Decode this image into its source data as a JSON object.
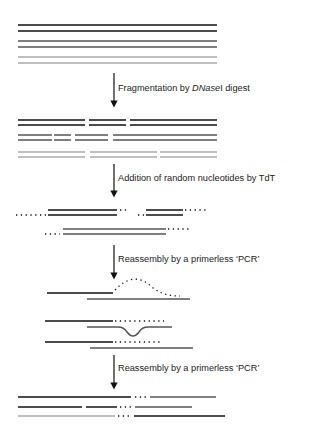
{
  "diagram": {
    "type": "DNA shuffling workflow",
    "colors": {
      "strand_a": "#111111",
      "strand_b": "#555555",
      "strand_c": "#aaaaaa",
      "text": "#222222"
    },
    "steps": [
      {
        "label_pre": "Fragmentation by ",
        "label_italic": "DNase",
        "label_post": "I digest"
      },
      {
        "label": "Addition of random nucleotides by TdT"
      },
      {
        "label": "Reassembly by a primerless ‘PCR’"
      },
      {
        "label": "Reassembly by a primerless ‘PCR’"
      }
    ],
    "stages": [
      "Parental genes (three double-stranded variants)",
      "DNaseI fragments",
      "Fragments with random 3' nucleotide tails",
      "Annealed fragments with mismatched tails",
      "Extension with mismatch loop",
      "Shuffled chimeric genes"
    ]
  }
}
